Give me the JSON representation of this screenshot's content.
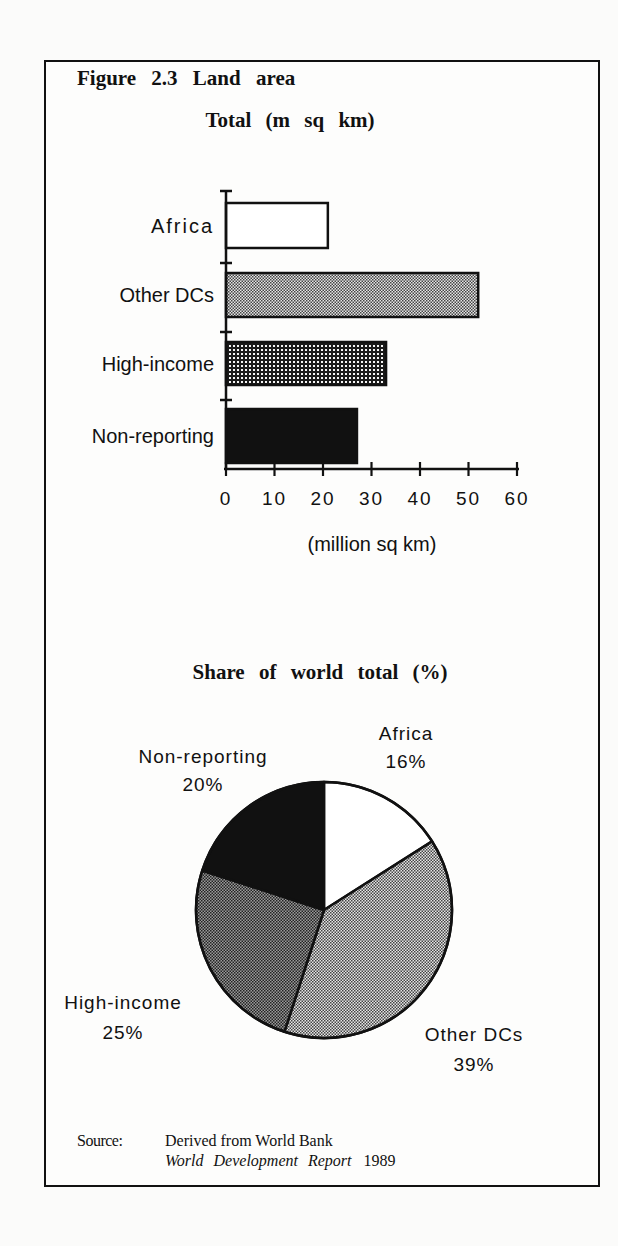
{
  "figure": {
    "title": "Figure 2.3 Land area",
    "source_label": "Source:",
    "source_line1": "Derived from World Bank",
    "source_line2_italic": "World Development Report",
    "source_line2_year": "1989"
  },
  "colors": {
    "ink": "#111111",
    "paper": "#fdfdfc",
    "africa_fill": "#ffffff",
    "other_dcs_fill": "#c8c8c8",
    "high_income_fill": "#8a8a8a",
    "non_reporting_fill": "#111111"
  },
  "chart_data": [
    {
      "type": "bar",
      "orientation": "horizontal",
      "title": "Total (m sq km)",
      "categories": [
        "Africa",
        "Other DCs",
        "High-income",
        "Non-reporting"
      ],
      "values": [
        21,
        52,
        33,
        27
      ],
      "xlabel": "(million sq km)",
      "ylabel": "",
      "xlim": [
        0,
        60
      ],
      "xticks": [
        "0",
        "10",
        "20",
        "30",
        "40",
        "50",
        "60"
      ],
      "grid": false,
      "legend": "none"
    },
    {
      "type": "pie",
      "title": "Share of world total (%)",
      "categories": [
        "Africa",
        "Other DCs",
        "High-income",
        "Non-reporting"
      ],
      "values": [
        16,
        39,
        25,
        20
      ],
      "labels": [
        "16%",
        "39%",
        "25%",
        "20%"
      ],
      "start_angle": "12 o'clock, clockwise",
      "legend": "direct labels"
    }
  ]
}
